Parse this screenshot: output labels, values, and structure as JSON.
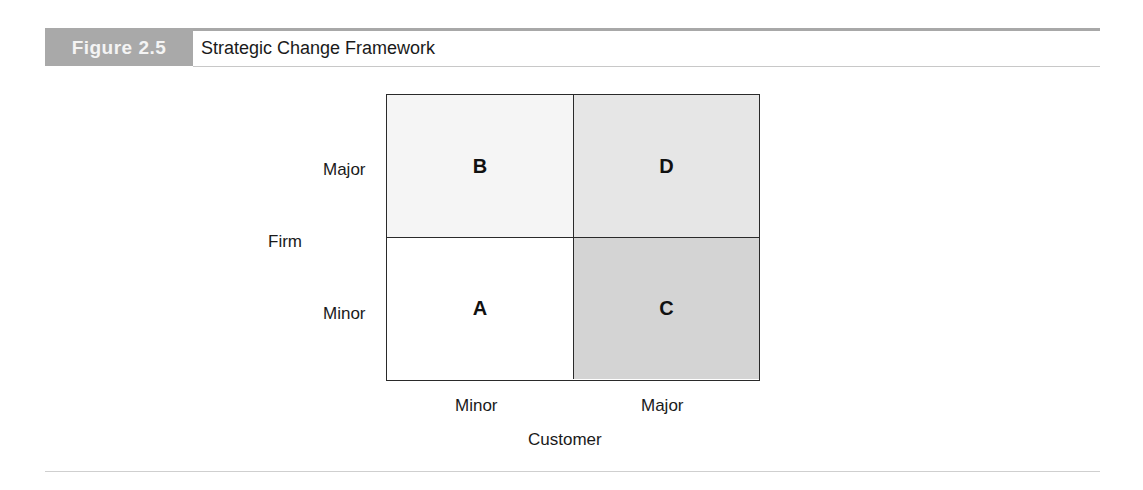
{
  "header": {
    "figure_number": "Figure 2.5",
    "title": "Strategic Change Framework"
  },
  "diagram": {
    "type": "2x2 matrix",
    "y_axis": {
      "label": "Firm",
      "ticks": [
        "Major",
        "Minor"
      ]
    },
    "x_axis": {
      "label": "Customer",
      "ticks": [
        "Minor",
        "Major"
      ]
    },
    "cells": {
      "top_left": "B",
      "top_right": "D",
      "bottom_left": "A",
      "bottom_right": "C"
    },
    "colors": {
      "top_left": "#f5f5f5",
      "top_right": "#e6e6e6",
      "bottom_left": "#ffffff",
      "bottom_right": "#d4d4d4",
      "border": "#2a2a2a",
      "figure_label_bg": "#a9a9a9"
    }
  }
}
